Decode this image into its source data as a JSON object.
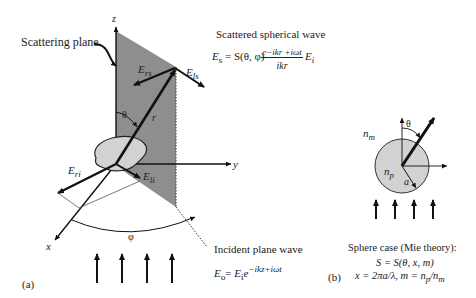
{
  "panel_a": {
    "label": "(a)",
    "axes": {
      "z": "z",
      "y": "y",
      "x": "x"
    },
    "scattering_plane_label": "Scattering plane",
    "theta": "θ",
    "phi": "φ",
    "r": "r",
    "vectors": {
      "E_rs": "E",
      "E_rs_sub": "rs",
      "E_ls": "E",
      "E_ls_sub": "ls",
      "E_ri": "E",
      "E_ri_sub": "ri",
      "E_li": "E",
      "E_li_sub": "li"
    },
    "scattered_wave": {
      "title": "Scattered spherical wave",
      "lhs": "E",
      "lhs_sub": "s",
      "eq": "= S(θ, φ)",
      "numerator": "e−ikr +iωt",
      "denominator": "ikr",
      "rhs": "E",
      "rhs_sub": "i"
    },
    "incident_wave": {
      "title": "Incident plane wave",
      "lhs": "E",
      "lhs_sub": "o",
      "eq": "= ",
      "rhs": "E",
      "rhs_sub": "i",
      "exp": "e",
      "exp_sup": "−ikz+iωt"
    }
  },
  "panel_b": {
    "label": "(b)",
    "medium_index": "n",
    "medium_index_sub": "m",
    "particle_index": "n",
    "particle_index_sub": "p",
    "radius": "a",
    "theta": "θ",
    "title": "Sphere case (Mie theory):",
    "eq1": "S = S(θ, x, m)",
    "eq2": "x = 2πa/λ,  m = n",
    "eq2_p": "p",
    "eq2_tail": "/n",
    "eq2_m": "m"
  },
  "colors": {
    "plane": "#8e8e8e",
    "particle": "#d2d2d2",
    "line": "#111111"
  }
}
